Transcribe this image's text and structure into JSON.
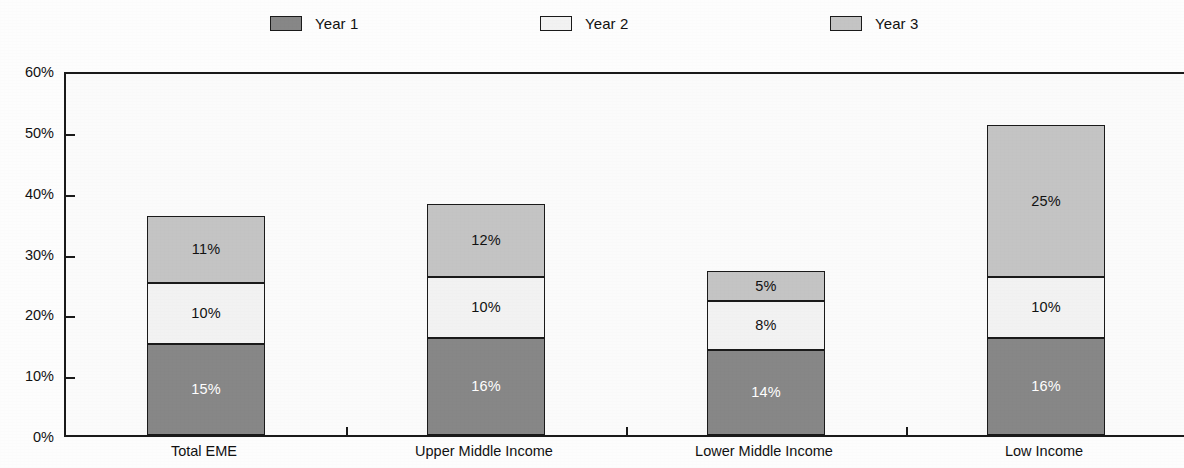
{
  "legend": {
    "items": [
      {
        "label": "Year 1",
        "color": "#878787",
        "text_color": "#ffffff"
      },
      {
        "label": "Year 2",
        "color": "#f2f2f2",
        "text_color": "#111111"
      },
      {
        "label": "Year 3",
        "color": "#c4c4c4",
        "text_color": "#111111"
      }
    ]
  },
  "axis": {
    "y_ticks": [
      "0%",
      "10%",
      "20%",
      "30%",
      "40%",
      "50%",
      "60%"
    ]
  },
  "chart_data": {
    "type": "bar",
    "stacked": true,
    "title": "",
    "xlabel": "",
    "ylabel": "",
    "ylim": [
      0,
      60
    ],
    "ytick_values": [
      0,
      10,
      20,
      30,
      40,
      50,
      60
    ],
    "ytick_labels": [
      "0%",
      "10%",
      "20%",
      "30%",
      "40%",
      "50%",
      "60%"
    ],
    "grid": false,
    "legend_position": "top",
    "categories": [
      "Total EME",
      "Upper Middle Income",
      "Lower Middle Income",
      "Low Income"
    ],
    "series": [
      {
        "name": "Year 1",
        "color": "#878787",
        "text_color": "#ffffff",
        "values": [
          15,
          16,
          14,
          16
        ],
        "labels": [
          "15%",
          "16%",
          "14%",
          "16%"
        ]
      },
      {
        "name": "Year 2",
        "color": "#f2f2f2",
        "text_color": "#111111",
        "values": [
          10,
          10,
          8,
          10
        ],
        "labels": [
          "10%",
          "10%",
          "8%",
          "10%"
        ]
      },
      {
        "name": "Year 3",
        "color": "#c4c4c4",
        "text_color": "#111111",
        "values": [
          11,
          12,
          5,
          25
        ],
        "labels": [
          "11%",
          "12%",
          "5%",
          "25%"
        ]
      }
    ],
    "totals": [
      36,
      38,
      27,
      51
    ]
  }
}
